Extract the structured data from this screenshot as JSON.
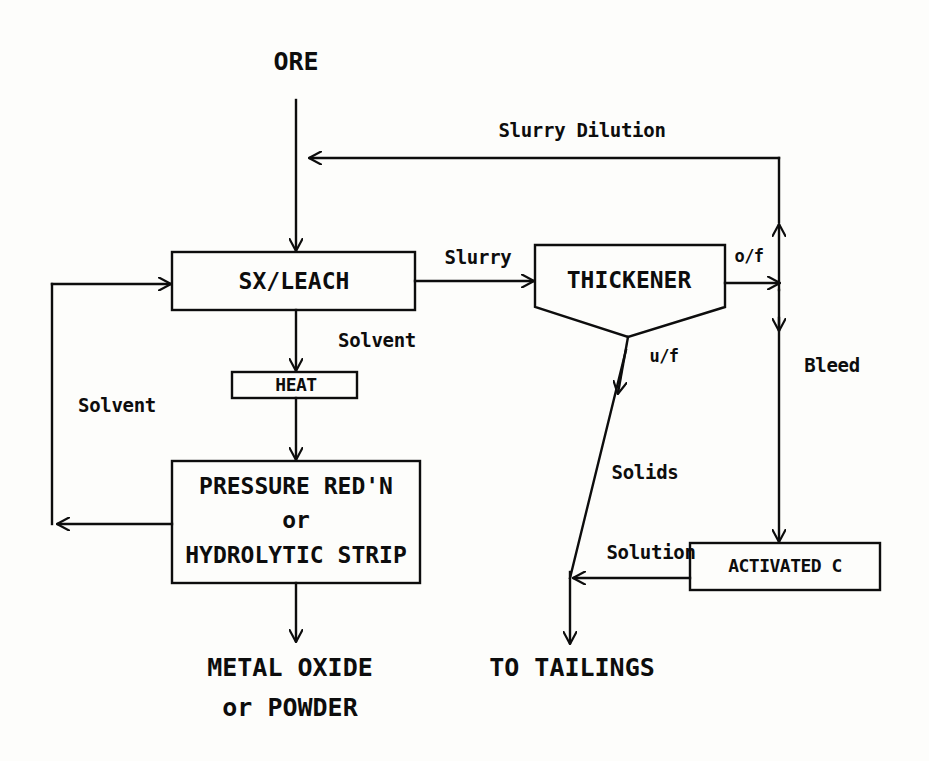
{
  "diagram": {
    "type": "process-flow-diagram",
    "stroke_color": "#0d0d0d",
    "background_color": "#fdfdfb",
    "nodes": {
      "ore": {
        "label": "ORE",
        "shape": "terminal-text"
      },
      "sx_leach": {
        "label": "SX/LEACH",
        "shape": "rectangle"
      },
      "heat": {
        "label": "HEAT",
        "shape": "rectangle"
      },
      "pressure": {
        "line1": "PRESSURE RED'N",
        "line2": "or",
        "line3": "HYDROLYTIC STRIP",
        "shape": "rectangle"
      },
      "metal_oxide": {
        "line1": "METAL OXIDE",
        "line2": "or POWDER",
        "shape": "terminal-text"
      },
      "thickener": {
        "label": "THICKENER",
        "shape": "thickener-vessel"
      },
      "activated_c": {
        "label": "ACTIVATED C",
        "shape": "rectangle"
      },
      "tailings": {
        "label": "TO TAILINGS",
        "shape": "terminal-text"
      }
    },
    "edge_labels": {
      "slurry_dilution": "Slurry Dilution",
      "slurry": "Slurry",
      "solvent_from_leach": "Solvent",
      "solvent_recycle": "Solvent",
      "overflow": "o/f",
      "underflow": "u/f",
      "bleed": "Bleed",
      "solids": "Solids",
      "solution": "Solution"
    },
    "edges": [
      {
        "from": "ore",
        "to": "sx_leach",
        "label": ""
      },
      {
        "from": "thickener_overflow",
        "to": "sx_leach",
        "label": "Slurry Dilution"
      },
      {
        "from": "sx_leach",
        "to": "thickener",
        "label": "Slurry"
      },
      {
        "from": "sx_leach",
        "to": "heat",
        "label": "Solvent"
      },
      {
        "from": "heat",
        "to": "pressure",
        "label": ""
      },
      {
        "from": "pressure",
        "to": "sx_leach",
        "label": "Solvent"
      },
      {
        "from": "pressure",
        "to": "metal_oxide",
        "label": ""
      },
      {
        "from": "thickener",
        "to": "overflow_junction",
        "label": "o/f"
      },
      {
        "from": "thickener",
        "to": "tailings",
        "label": "u/f"
      },
      {
        "from": "overflow_junction",
        "to": "activated_c",
        "label": "Bleed"
      },
      {
        "from": "underflow_line",
        "to": "tailings",
        "label": "Solids"
      },
      {
        "from": "activated_c",
        "to": "tailings_junction",
        "label": "Solution"
      }
    ]
  }
}
